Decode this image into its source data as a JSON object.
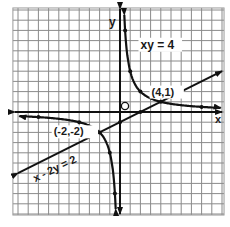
{
  "chart_data": {
    "type": "line",
    "title": "",
    "xlabel": "x",
    "ylabel": "y",
    "origin_label": "O",
    "xlim": [
      -10.5,
      10.2
    ],
    "ylim": [
      -10.1,
      10.2
    ],
    "grid": true,
    "grid_step": 1,
    "series": [
      {
        "name": "xy = 4",
        "kind": "hyperbola",
        "equation": "xy = 4",
        "marked_points": [
          [
            0.5,
            8
          ],
          [
            1,
            4
          ],
          [
            2,
            2
          ],
          [
            4,
            1
          ],
          [
            8,
            0.5
          ],
          [
            -0.5,
            -8
          ],
          [
            -1,
            -4
          ],
          [
            -2,
            -2
          ],
          [
            -4,
            -1
          ],
          [
            -8,
            -0.5
          ]
        ]
      },
      {
        "name": "x - 2y = 2",
        "kind": "line",
        "equation": "x - 2y = 2",
        "x_range": [
          -10,
          10
        ],
        "marked_points": [
          [
            0,
            -1
          ],
          [
            2,
            0
          ]
        ]
      }
    ],
    "annotations": [
      {
        "text": "xy = 4",
        "x": 2.3,
        "y": 6.2
      },
      {
        "text": "(4,1)",
        "x": 3.0,
        "y": 2.1
      },
      {
        "text": "(-2,-2)",
        "x": -6.5,
        "y": -1.8
      },
      {
        "text": "x - 2y = 2",
        "x": -8.3,
        "y": -6.3
      }
    ],
    "intersections": [
      [
        4,
        1
      ],
      [
        -2,
        -2
      ]
    ]
  }
}
